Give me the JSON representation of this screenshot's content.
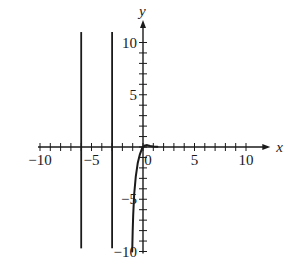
{
  "chart_data": {
    "type": "line",
    "title": "",
    "xlabel": "x",
    "ylabel": "y",
    "xlim": [
      -10,
      11
    ],
    "ylim": [
      -10,
      11
    ],
    "grid": false,
    "x_ticks": [
      -10,
      -9,
      -8,
      -7,
      -6,
      -5,
      -4,
      -3,
      -2,
      -1,
      0,
      1,
      2,
      3,
      4,
      5,
      6,
      7,
      8,
      9,
      10
    ],
    "y_ticks": [
      -10,
      -9,
      -8,
      -7,
      -6,
      -5,
      -4,
      -3,
      -2,
      -1,
      0,
      1,
      2,
      3,
      4,
      5,
      6,
      7,
      8,
      9,
      10
    ],
    "x_tick_labels": [
      {
        "value": -10,
        "label": "−10"
      },
      {
        "value": -5,
        "label": "−5"
      },
      {
        "value": 0,
        "label": "0"
      },
      {
        "value": 5,
        "label": "5"
      },
      {
        "value": 10,
        "label": "10"
      }
    ],
    "y_tick_labels": [
      {
        "value": 10,
        "label": "10"
      },
      {
        "value": 5,
        "label": "5"
      },
      {
        "value": -5,
        "label": "−5"
      },
      {
        "value": -10,
        "label": "−10"
      }
    ],
    "series": [
      {
        "name": "vertical line x=-6",
        "kind": "vertical",
        "x": [
          -6,
          -6
        ],
        "y": [
          -9.7,
          11
        ]
      },
      {
        "name": "vertical line x=-3",
        "kind": "vertical",
        "x": [
          -3,
          -3
        ],
        "y": [
          -9.7,
          11
        ]
      },
      {
        "name": "curve",
        "kind": "curve",
        "x": [
          -1.05,
          -1.0,
          -0.95,
          -0.85,
          -0.7,
          -0.5,
          -0.3,
          -0.1,
          0.0,
          0.2,
          0.4,
          0.7,
          1.0,
          1.4
        ],
        "y": [
          -10,
          -8.0,
          -6.5,
          -4.5,
          -2.8,
          -1.5,
          -0.7,
          -0.15,
          0.0,
          0.15,
          0.18,
          0.1,
          0.04,
          0.02
        ]
      }
    ],
    "legend": null
  }
}
